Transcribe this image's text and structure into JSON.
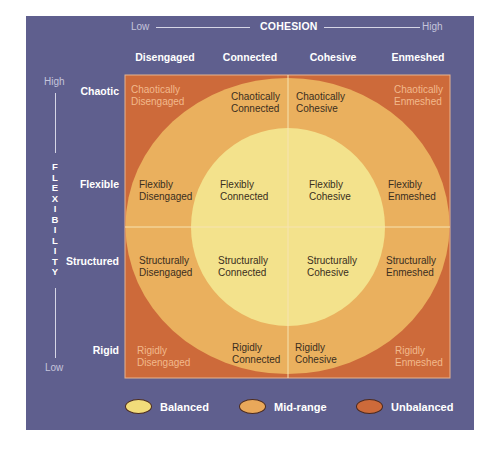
{
  "cohesion_axis": {
    "low_label": "Low",
    "title": "COHESION",
    "high_label": "High",
    "columns": [
      "Disengaged",
      "Connected",
      "Cohesive",
      "Enmeshed"
    ]
  },
  "flexibility_axis": {
    "high_label": "High",
    "title_letters": [
      "F",
      "L",
      "E",
      "X",
      "I",
      "B",
      "I",
      "L",
      "I",
      "T",
      "Y"
    ],
    "low_label": "Low",
    "rows": [
      "Chaotic",
      "Flexible",
      "Structured",
      "Rigid"
    ]
  },
  "cells": {
    "chaotic": {
      "disengaged": [
        "Chaotically",
        "Disengaged"
      ],
      "connected": [
        "Chaotically",
        "Connected"
      ],
      "cohesive": [
        "Chaotically",
        "Cohesive"
      ],
      "enmeshed": [
        "Chaotically",
        "Enmeshed"
      ]
    },
    "flexible": {
      "disengaged": [
        "Flexibly",
        "Disengaged"
      ],
      "connected": [
        "Flexibly",
        "Connected"
      ],
      "cohesive": [
        "Flexibly",
        "Cohesive"
      ],
      "enmeshed": [
        "Flexibly",
        "Enmeshed"
      ]
    },
    "structured": {
      "disengaged": [
        "Structurally",
        "Disengaged"
      ],
      "connected": [
        "Structurally",
        "Connected"
      ],
      "cohesive": [
        "Structurally",
        "Cohesive"
      ],
      "enmeshed": [
        "Structurally",
        "Enmeshed"
      ]
    },
    "rigid": {
      "disengaged": [
        "Rigidly",
        "Disengaged"
      ],
      "connected": [
        "Rigidly",
        "Connected"
      ],
      "cohesive": [
        "Rigidly",
        "Cohesive"
      ],
      "enmeshed": [
        "Rigidly",
        "Enmeshed"
      ]
    }
  },
  "legend": [
    {
      "label": "Balanced",
      "color": "#f2dc7a"
    },
    {
      "label": "Mid-range",
      "color": "#e9a85a"
    },
    {
      "label": "Unbalanced",
      "color": "#cd6a3a"
    }
  ],
  "colors": {
    "panel": "#5f5f8e",
    "unbalanced": "#cd6a3a",
    "midrange": "#eab05e",
    "balanced": "#f3e28c"
  }
}
